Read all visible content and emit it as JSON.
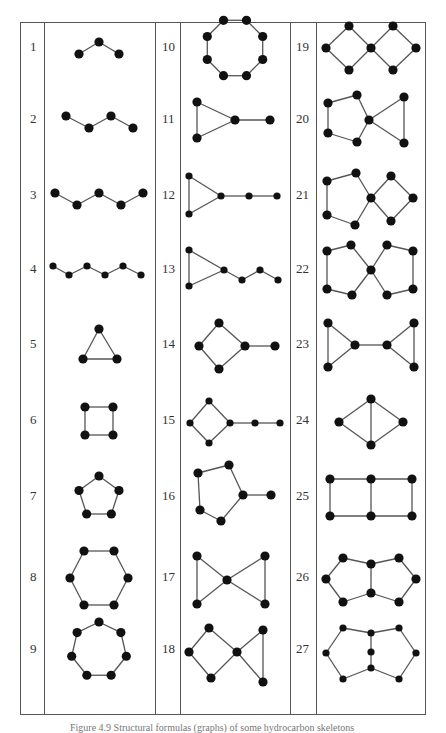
{
  "figure": {
    "caption": "Figure 4.9  Structural formulas (graphs) of some hydrocarbon skeletons",
    "colors": {
      "node": "#111111",
      "edge": "#555555",
      "border": "#555555"
    },
    "graphs": [
      {
        "id": "1",
        "label": "1",
        "kind": "chain",
        "nodes": 3
      },
      {
        "id": "2",
        "label": "2",
        "kind": "chain",
        "nodes": 4
      },
      {
        "id": "3",
        "label": "3",
        "kind": "chain",
        "nodes": 5
      },
      {
        "id": "4",
        "label": "4",
        "kind": "chain",
        "nodes": 6
      },
      {
        "id": "5",
        "label": "5",
        "kind": "cycle",
        "nodes": 3
      },
      {
        "id": "6",
        "label": "6",
        "kind": "cycle",
        "nodes": 4
      },
      {
        "id": "7",
        "label": "7",
        "kind": "cycle",
        "nodes": 5
      },
      {
        "id": "8",
        "label": "8",
        "kind": "cycle",
        "nodes": 6
      },
      {
        "id": "9",
        "label": "9",
        "kind": "cycle",
        "nodes": 7
      },
      {
        "id": "10",
        "label": "10",
        "kind": "cycle",
        "nodes": 8
      },
      {
        "id": "11",
        "label": "11",
        "kind": "cycle-with-tail",
        "ring": 3,
        "tail": 1
      },
      {
        "id": "12",
        "label": "12",
        "kind": "cycle-with-tail",
        "ring": 3,
        "tail": 2
      },
      {
        "id": "13",
        "label": "13",
        "kind": "cycle-with-tail",
        "ring": 3,
        "tail": 3
      },
      {
        "id": "14",
        "label": "14",
        "kind": "cycle-with-tail",
        "ring": 4,
        "tail": 1
      },
      {
        "id": "15",
        "label": "15",
        "kind": "cycle-with-tail",
        "ring": 4,
        "tail": 2
      },
      {
        "id": "16",
        "label": "16",
        "kind": "cycle-with-tail",
        "ring": 5,
        "tail": 1
      },
      {
        "id": "17",
        "label": "17",
        "kind": "spiro",
        "rings": [
          3,
          3
        ]
      },
      {
        "id": "18",
        "label": "18",
        "kind": "spiro",
        "rings": [
          4,
          3
        ]
      },
      {
        "id": "19",
        "label": "19",
        "kind": "spiro",
        "rings": [
          4,
          4
        ]
      },
      {
        "id": "20",
        "label": "20",
        "kind": "spiro",
        "rings": [
          5,
          3
        ]
      },
      {
        "id": "21",
        "label": "21",
        "kind": "spiro",
        "rings": [
          5,
          4
        ]
      },
      {
        "id": "22",
        "label": "22",
        "kind": "spiro",
        "rings": [
          5,
          5
        ]
      },
      {
        "id": "23",
        "label": "23",
        "kind": "bridged-rings",
        "rings": [
          3,
          3
        ],
        "bridge_edges": 1
      },
      {
        "id": "24",
        "label": "24",
        "kind": "fused",
        "rings": [
          3,
          3
        ]
      },
      {
        "id": "25",
        "label": "25",
        "kind": "fused",
        "rings": [
          4,
          4
        ]
      },
      {
        "id": "26",
        "label": "26",
        "kind": "fused",
        "rings": [
          5,
          5
        ]
      },
      {
        "id": "27",
        "label": "27",
        "kind": "fused-path",
        "rings": [
          6,
          6
        ],
        "shared_nodes": 3
      }
    ]
  }
}
